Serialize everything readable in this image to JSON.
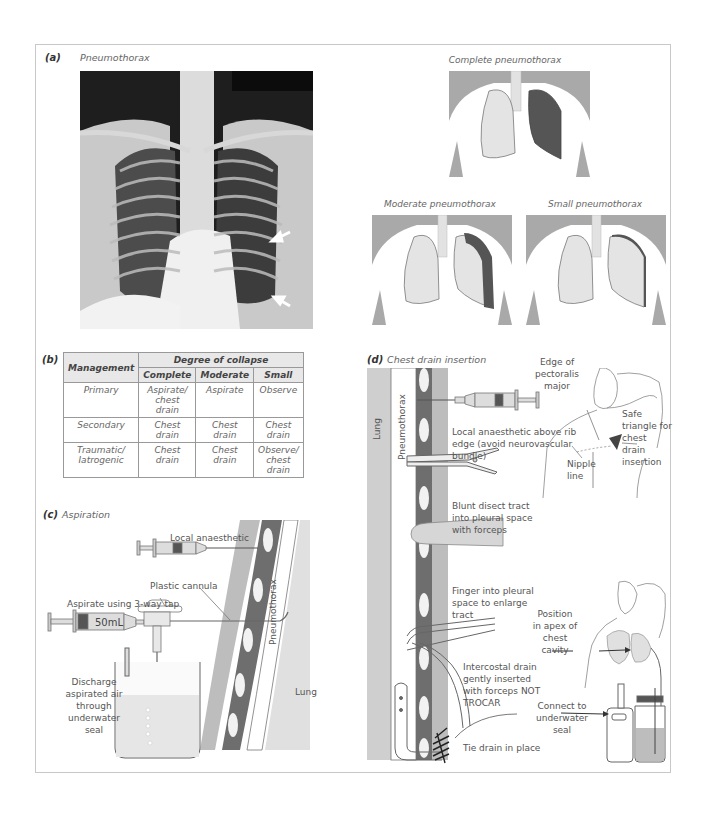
{
  "panel_a": {
    "label": "(a)",
    "title": "Pneumothorax",
    "diagrams": [
      {
        "caption": "Complete pneumothorax"
      },
      {
        "caption": "Moderate pneumothorax"
      },
      {
        "caption": "Small pneumothorax"
      }
    ]
  },
  "panel_b": {
    "label": "(b)",
    "header_management": "Management",
    "header_group": "Degree of collapse",
    "columns": [
      "Complete",
      "Moderate",
      "Small"
    ],
    "rows": [
      {
        "type": "Primary",
        "complete": "Aspirate/ chest drain",
        "moderate": "Aspirate",
        "small": "Observe"
      },
      {
        "type": "Secondary",
        "complete": "Chest drain",
        "moderate": "Chest drain",
        "small": "Chest drain"
      },
      {
        "type": "Traumatic/ Iatrogenic",
        "complete": "Chest drain",
        "moderate": "Chest drain",
        "small": "Observe/ chest drain"
      }
    ]
  },
  "panel_c": {
    "label": "(c)",
    "title": "Aspiration",
    "labels": {
      "local_anaesthetic": "Local anaesthetic",
      "plastic_cannula": "Plastic cannula",
      "aspirate": "Aspirate using 3-way tap",
      "syringe_volume": "50mL",
      "discharge": "Discharge aspirated air through underwater seal",
      "pneumothorax": "Pneumothorax",
      "lung": "Lung"
    }
  },
  "panel_d": {
    "label": "(d)",
    "title": "Chest drain insertion",
    "labels": {
      "lung": "Lung",
      "pneumothorax": "Pneumothorax",
      "edge_pectoralis": "Edge of pectoralis major",
      "safe_triangle": "Safe triangle for chest drain insertion",
      "nipple_line": "Nipple line",
      "local_anaesthetic": "Local anaesthetic above rib edge (avoid neurovascular bundle)",
      "blunt_dissect": "Blunt disect tract into pleural space with forceps",
      "finger": "Finger into pleural space to enlarge tract",
      "position_apex": "Position in apex of chest cavity",
      "intercostal_drain": "Intercostal drain gently inserted with forceps NOT TROCAR",
      "connect": "Connect to underwater seal",
      "tie_drain": "Tie drain in place"
    }
  },
  "colors": {
    "frame": "#c8c8c8",
    "lung_light": "#e4e4e4",
    "lung_collapsed": "#555555",
    "pleura_dark": "#6e6e6e",
    "chest_wall": "#bdbdbd",
    "body_shade": "#a9a9a9"
  }
}
